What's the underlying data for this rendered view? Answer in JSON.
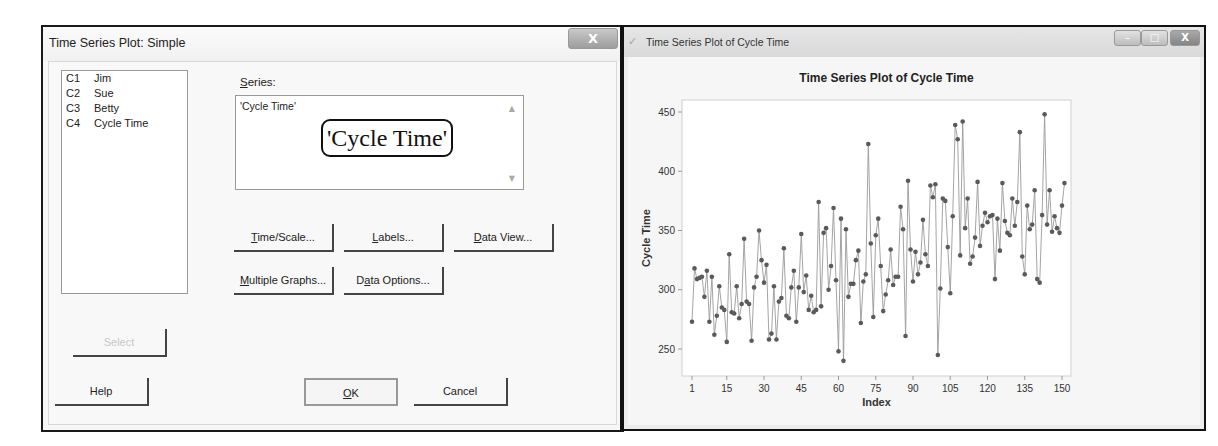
{
  "dialog": {
    "title": "Time Series Plot: Simple",
    "close_label": "X",
    "variables": [
      {
        "col": "C1",
        "name": "Jim"
      },
      {
        "col": "C2",
        "name": "Sue"
      },
      {
        "col": "C3",
        "name": "Betty"
      },
      {
        "col": "C4",
        "name": "Cycle Time"
      }
    ],
    "series_label": "Series:",
    "series_label_access": "S",
    "series_label_rest": "eries:",
    "series_value": "'Cycle Time'",
    "series_callout": "'Cycle Time'",
    "buttons": {
      "time_scale": "Time/Scale...",
      "labels": "Labels...",
      "data_view": "Data View...",
      "multiple_graphs": "Multiple Graphs...",
      "data_options": "Data Options...",
      "select": "Select",
      "help": "Help",
      "ok": "OK",
      "cancel": "Cancel"
    }
  },
  "graph_window": {
    "title": "Time Series Plot of Cycle Time",
    "icon": "minitab-graph-icon",
    "controls": {
      "minimize": "–",
      "maximize": "□",
      "close": "X"
    }
  },
  "colors": {
    "series_line": "#9a9a9a",
    "series_marker": "#5a5a5a",
    "frame": "#d0d0d0",
    "window_border": "#111111"
  },
  "chart_data": {
    "type": "line",
    "title": "Time Series Plot of Cycle Time",
    "xlabel": "Index",
    "ylabel": "Cycle Time",
    "xticks": [
      1,
      15,
      30,
      45,
      60,
      75,
      90,
      105,
      120,
      135,
      150
    ],
    "yticks": [
      250,
      300,
      350,
      400,
      450
    ],
    "xlim": [
      1,
      150
    ],
    "ylim": [
      232,
      460
    ],
    "grid": false,
    "legend": null,
    "markers": true,
    "series": [
      {
        "name": "Cycle Time",
        "values": [
          273,
          318,
          309,
          310,
          311,
          294,
          316,
          273,
          311,
          262,
          278,
          303,
          285,
          283,
          256,
          330,
          281,
          280,
          303,
          276,
          288,
          343,
          290,
          288,
          257,
          302,
          311,
          350,
          325,
          306,
          321,
          258,
          263,
          303,
          258,
          290,
          293,
          335,
          278,
          276,
          302,
          316,
          273,
          302,
          347,
          298,
          312,
          283,
          295,
          281,
          283,
          374,
          286,
          348,
          352,
          300,
          320,
          369,
          308,
          248,
          360,
          240,
          351,
          294,
          305,
          305,
          325,
          333,
          272,
          307,
          313,
          423,
          339,
          277,
          346,
          360,
          320,
          282,
          296,
          308,
          334,
          304,
          311,
          311,
          370,
          351,
          261,
          392,
          334,
          307,
          332,
          313,
          323,
          359,
          330,
          320,
          388,
          378,
          389,
          245,
          301,
          377,
          375,
          336,
          297,
          362,
          439,
          427,
          329,
          442,
          352,
          377,
          322,
          328,
          344,
          391,
          337,
          354,
          365,
          357,
          362,
          363,
          309,
          360,
          333,
          390,
          358,
          348,
          346,
          377,
          354,
          374,
          433,
          328,
          313,
          371,
          351,
          355,
          384,
          309,
          306,
          363,
          448,
          355,
          384,
          349,
          362,
          352,
          348,
          371,
          390
        ]
      }
    ]
  }
}
